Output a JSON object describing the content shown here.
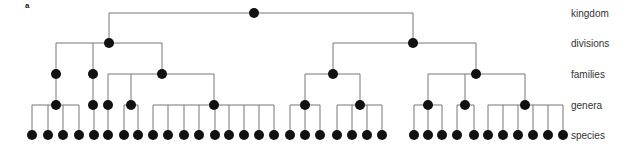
{
  "panel_label": "a",
  "levels": [
    {
      "label": "kingdom",
      "y": 13
    },
    {
      "label": "divisions",
      "y": 43
    },
    {
      "label": "families",
      "y": 74
    },
    {
      "label": "genera",
      "y": 105
    },
    {
      "label": "species",
      "y": 135
    }
  ],
  "style": {
    "line_color": "#777777",
    "node_color": "#111111",
    "node_radius": 5
  },
  "tree": {
    "level": "kingdom",
    "x": 254,
    "children": [
      {
        "level": "divisions",
        "x": 109,
        "children": [
          {
            "level": "families",
            "x": 56,
            "children": [
              {
                "level": "genera",
                "x": 56,
                "children": [
                  32,
                  48,
                  63,
                  79
                ]
              }
            ]
          },
          {
            "level": "families",
            "x": 93,
            "children": [
              {
                "level": "genera",
                "x": 93,
                "children": [
                  94
                ]
              }
            ]
          },
          {
            "level": "families",
            "x": 162,
            "children": [
              {
                "level": "genera",
                "x": 108,
                "children": [
                  108
                ]
              },
              {
                "level": "genera",
                "x": 131,
                "children": [
                  124,
                  138
                ]
              },
              {
                "level": "genera",
                "x": 214,
                "children": [
                  153,
                  168,
                  184,
                  199,
                  215,
                  229,
                  244,
                  259,
                  274
                ]
              }
            ]
          }
        ]
      },
      {
        "level": "divisions",
        "x": 413,
        "children": [
          {
            "level": "families",
            "x": 333,
            "children": [
              {
                "level": "genera",
                "x": 305,
                "children": [
                  290,
                  305,
                  320
                ]
              },
              {
                "level": "genera",
                "x": 360,
                "children": [
                  337,
                  352,
                  367,
                  382
                ]
              }
            ]
          },
          {
            "level": "families",
            "x": 476,
            "children": [
              {
                "level": "genera",
                "x": 428,
                "children": [
                  414,
                  428,
                  442
                ]
              },
              {
                "level": "genera",
                "x": 465,
                "children": [
                  457,
                  474
                ]
              },
              {
                "level": "genera",
                "x": 525,
                "children": [
                  488,
                  503,
                  518,
                  533,
                  548,
                  563
                ]
              }
            ]
          }
        ]
      }
    ]
  }
}
